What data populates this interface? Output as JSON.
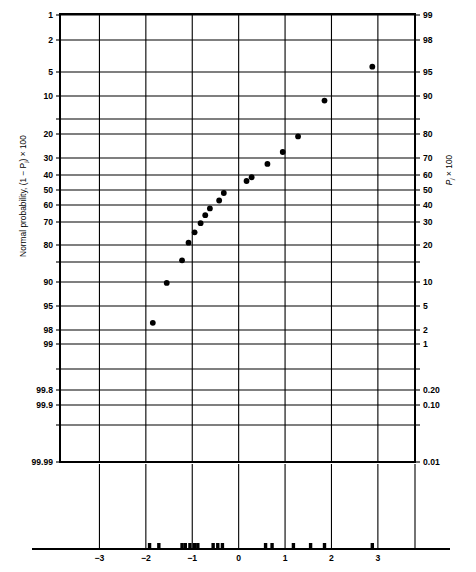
{
  "figure": {
    "title": "",
    "left_axis_title": "Normal probability, (1 − P",
    "left_axis_title_sub": "j",
    "left_axis_title_tail": ") × 100",
    "right_axis_title": "P",
    "right_axis_title_sub": "j",
    "right_axis_title_tail": " × 100",
    "background_color": "#ffffff",
    "line_color": "#000000",
    "marker_color": "#000000"
  },
  "chart_data": {
    "type": "scatter",
    "title": "",
    "xlabel": "",
    "ylabel": "Normal probability, (1 − Pj) × 100",
    "ylabel_right": "Pj × 100",
    "grid": true,
    "legend": "none",
    "xlim": [
      -3.85,
      3.8
    ],
    "x_ticks": [
      -3,
      -2,
      -1,
      0,
      1,
      2,
      3
    ],
    "x_tick_labels": [
      "−3",
      "−2",
      "−1",
      "0",
      "1",
      "2",
      "3"
    ],
    "x_gridlines": [
      -3,
      -2,
      -1,
      0,
      1,
      2,
      3,
      3.8
    ],
    "y_scale": "normal-probability",
    "y_ticks_left": [
      1,
      2,
      5,
      10,
      15,
      20,
      30,
      40,
      50,
      60,
      70,
      80,
      85,
      90,
      95,
      98,
      99,
      99.5,
      99.8,
      99.9,
      99.95,
      99.99
    ],
    "y_tick_labels_left": [
      "1",
      "2",
      "5",
      "10",
      "",
      "20",
      "30",
      "40",
      "50",
      "60",
      "70",
      "80",
      "",
      "90",
      "95",
      "98",
      "99",
      "",
      "99.8",
      "99.9",
      "",
      "99.99"
    ],
    "y_tick_labels_right": [
      "99",
      "98",
      "95",
      "90",
      "",
      "80",
      "70",
      "60",
      "50",
      "40",
      "30",
      "20",
      "",
      "10",
      "5",
      "2",
      "1",
      "",
      "0.20",
      "0.10",
      "",
      "0.01"
    ],
    "y_pixel_positions": [
      15,
      40,
      72,
      96,
      119,
      134,
      158,
      175,
      190,
      205,
      222,
      245,
      262,
      282,
      306,
      330,
      344,
      369,
      390,
      405,
      425,
      462
    ],
    "points": [
      {
        "x": -1.85,
        "y_left": 97.1
      },
      {
        "x": -1.55,
        "y_left": 90.2
      },
      {
        "x": -1.22,
        "y_left": 84.5
      },
      {
        "x": -1.08,
        "y_left": 79.0
      },
      {
        "x": -0.95,
        "y_left": 74.5
      },
      {
        "x": -0.82,
        "y_left": 70.5
      },
      {
        "x": -0.72,
        "y_left": 66.0
      },
      {
        "x": -0.62,
        "y_left": 62.0
      },
      {
        "x": -0.42,
        "y_left": 57.0
      },
      {
        "x": -0.32,
        "y_left": 52.0
      },
      {
        "x": 0.17,
        "y_left": 44.0
      },
      {
        "x": 0.28,
        "y_left": 41.5
      },
      {
        "x": 0.62,
        "y_left": 33.5
      },
      {
        "x": 0.95,
        "y_left": 27.5
      },
      {
        "x": 1.28,
        "y_left": 21.0
      },
      {
        "x": 1.85,
        "y_left": 11.0
      },
      {
        "x": 2.88,
        "y_left": 4.5
      }
    ],
    "rug_marks": [
      -1.92,
      -1.72,
      -1.22,
      -1.15,
      -1.05,
      -0.95,
      -0.88,
      -0.55,
      -0.45,
      -0.35,
      0.58,
      0.72,
      1.18,
      1.55,
      1.85,
      2.88
    ]
  }
}
